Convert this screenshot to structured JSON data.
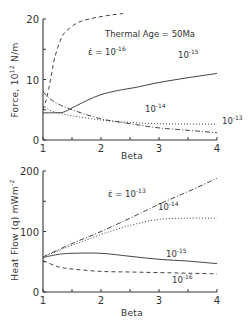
{
  "chart_data": [
    {
      "type": "line",
      "title": "",
      "annotation": "Thermal Age = 50Ma",
      "xlabel": "Beta",
      "ylabel": "Force, 10^12 N/m",
      "xlim": [
        1,
        4
      ],
      "ylim": [
        0,
        20
      ],
      "xticks": [
        "1",
        "2",
        "3",
        "4"
      ],
      "yticks": [
        "0",
        "10",
        "20"
      ],
      "grid": false,
      "series": [
        {
          "name": "ε̇ = 10^-16",
          "label_prefix": "ε̇ = 10",
          "exp": "-16",
          "style": "dashed",
          "x": [
            1.0,
            1.05,
            1.1,
            1.15,
            1.2,
            1.3,
            1.4,
            1.6,
            1.8,
            2.0,
            2.2,
            2.38
          ],
          "y": [
            5.0,
            6.5,
            8.5,
            11.0,
            13.5,
            16.5,
            18.0,
            19.4,
            20.0,
            20.4,
            20.7,
            20.9
          ]
        },
        {
          "name": "10^-15",
          "label_prefix": "10",
          "exp": "-15",
          "style": "solid",
          "x": [
            1.0,
            1.2,
            1.35,
            1.5,
            1.75,
            2.0,
            2.3,
            2.6,
            3.0,
            3.5,
            4.0
          ],
          "y": [
            4.5,
            4.5,
            4.6,
            5.3,
            6.5,
            7.5,
            8.2,
            8.7,
            9.5,
            10.3,
            11.0
          ]
        },
        {
          "name": "10^-14",
          "label_prefix": "10",
          "exp": "-14",
          "style": "dotted",
          "x": [
            1.0,
            1.1,
            1.25,
            1.5,
            2.0,
            2.5,
            3.0,
            3.5,
            4.0
          ],
          "y": [
            5.8,
            5.0,
            4.5,
            4.0,
            3.3,
            2.9,
            2.7,
            2.65,
            2.6
          ]
        },
        {
          "name": "10^-13",
          "label_prefix": "10",
          "exp": "-13",
          "style": "dashdot",
          "x": [
            1.0,
            1.1,
            1.25,
            1.5,
            2.0,
            2.5,
            3.0,
            3.5,
            4.0
          ],
          "y": [
            8.0,
            7.0,
            6.0,
            5.0,
            3.5,
            2.7,
            2.0,
            1.6,
            1.2
          ]
        }
      ]
    },
    {
      "type": "line",
      "title": "",
      "xlabel": "Beta",
      "ylabel": "Heat Flow (q) mWm^-2",
      "xlim": [
        1,
        4
      ],
      "ylim": [
        0,
        200
      ],
      "xticks": [
        "1",
        "2",
        "3",
        "4"
      ],
      "yticks": [
        "0",
        "100",
        "200"
      ],
      "grid": false,
      "series": [
        {
          "name": "ε̇ = 10^-13",
          "label_prefix": "ε̇ = 10",
          "exp": "-13",
          "style": "dashdot",
          "x": [
            1.0,
            1.5,
            2.0,
            2.5,
            3.0,
            3.5,
            4.0
          ],
          "y": [
            58,
            80,
            100,
            122,
            145,
            166,
            188
          ]
        },
        {
          "name": "10^-14",
          "label_prefix": "10",
          "exp": "-14",
          "style": "dotted",
          "x": [
            1.0,
            1.5,
            2.0,
            2.5,
            3.0,
            3.5,
            4.0
          ],
          "y": [
            58,
            77,
            95,
            110,
            120,
            122,
            122
          ]
        },
        {
          "name": "10^-15",
          "label_prefix": "10",
          "exp": "-15",
          "style": "solid",
          "x": [
            1.0,
            1.25,
            1.5,
            2.0,
            2.5,
            3.0,
            3.5,
            4.0
          ],
          "y": [
            57,
            62,
            64,
            64,
            59,
            54,
            51,
            47
          ]
        },
        {
          "name": "10^-16",
          "label_prefix": "10",
          "exp": "-16",
          "style": "dashed",
          "x": [
            1.0,
            1.25,
            1.5,
            2.0,
            2.5,
            3.0,
            3.5,
            4.0
          ],
          "y": [
            52,
            42,
            38,
            34,
            33,
            32,
            31,
            30
          ]
        }
      ]
    }
  ]
}
